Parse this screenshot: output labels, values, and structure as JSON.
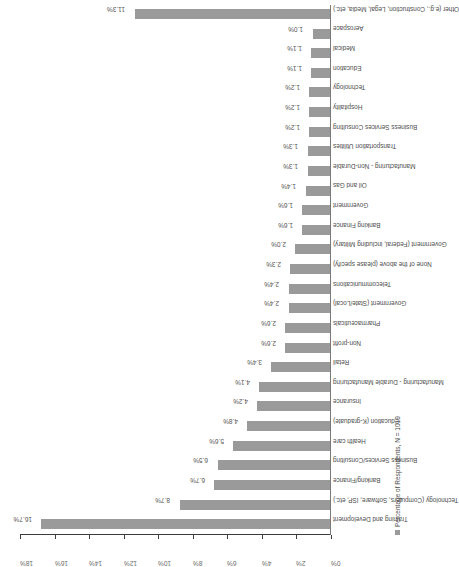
{
  "chart_data": {
    "type": "bar",
    "title": "",
    "subtitle": "",
    "xlabel": "",
    "ylabel": "",
    "orientation": "vertical-bars-on-rotated-page",
    "grid": false,
    "legend_position": "bottom-left",
    "axis_unit": "%",
    "xlim": [
      0,
      18
    ],
    "ylim": [
      0,
      18
    ],
    "tick_labels": [
      "0%",
      "2%",
      "4%",
      "6%",
      "8%",
      "10%",
      "12%",
      "14%",
      "16%",
      "18%"
    ],
    "tick_values": [
      0,
      2,
      4,
      6,
      8,
      10,
      12,
      14,
      16,
      18
    ],
    "bar_color": "#9a9a9a",
    "axis_color": "#3c3c3c",
    "label_color": "#4d4d4d",
    "categories": [
      "Training and Development",
      "Technology (Computers, Software, ISP, etc.)",
      "Banking/Finance",
      "Business Services/Consulting",
      "Health care",
      "Education (K-graduate)",
      "Insurance",
      "Manufacturing - Durable Manufacturing",
      "Retail",
      "Non-profit",
      "Pharmaceuticals",
      "Government (State/Local)",
      "Telecommunications",
      "None of the above (please specify)",
      "Government (Federal, including Military)",
      "Banking Finance",
      "Government",
      "Oil and Gas",
      "Manufacturing - Non-Durable",
      "Transportation Utilities",
      "Business Services Consulting",
      "Hospitality",
      "Technology",
      "Education",
      "Medical",
      "Aerospace",
      "Other (e.g., Construction, Legal, Media, etc.)"
    ],
    "values": [
      16.7,
      8.7,
      6.7,
      6.5,
      5.6,
      4.8,
      4.2,
      4.1,
      3.4,
      2.6,
      2.6,
      2.4,
      2.4,
      2.3,
      2.0,
      1.6,
      1.6,
      1.4,
      1.3,
      1.3,
      1.2,
      1.2,
      1.2,
      1.1,
      1.1,
      1.0,
      11.3
    ],
    "value_labels": [
      "16.7%",
      "8.7%",
      "6.7%",
      "6.5%",
      "5.6%",
      "4.8%",
      "4.2%",
      "4.1%",
      "3.4%",
      "2.6%",
      "2.6%",
      "2.4%",
      "2.4%",
      "2.3%",
      "2.0%",
      "1.6%",
      "1.6%",
      "1.4%",
      "1.3%",
      "1.3%",
      "1.2%",
      "1.2%",
      "1.2%",
      "1.1%",
      "1.1%",
      "1.0%",
      "11.3%"
    ],
    "series": [
      {
        "name": "Percentage of Respondents, N = 1019",
        "values": [
          16.7,
          8.7,
          6.7,
          6.5,
          5.6,
          4.8,
          4.2,
          4.1,
          3.4,
          2.6,
          2.6,
          2.4,
          2.4,
          2.3,
          2.0,
          1.6,
          1.6,
          1.4,
          1.3,
          1.3,
          1.2,
          1.2,
          1.2,
          1.1,
          1.1,
          1.0,
          11.3
        ]
      }
    ]
  },
  "legend": {
    "label": "Percentage of Respondents, N = 1019",
    "swatch_color": "#9a9a9a"
  }
}
